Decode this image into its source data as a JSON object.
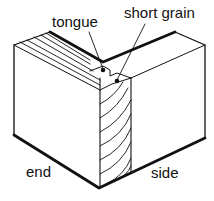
{
  "diagram": {
    "labels": {
      "tongue": "tongue",
      "short_grain": "short grain",
      "end": "end",
      "side": "side"
    },
    "colors": {
      "stroke": "#111111",
      "background": "#ffffff"
    }
  }
}
